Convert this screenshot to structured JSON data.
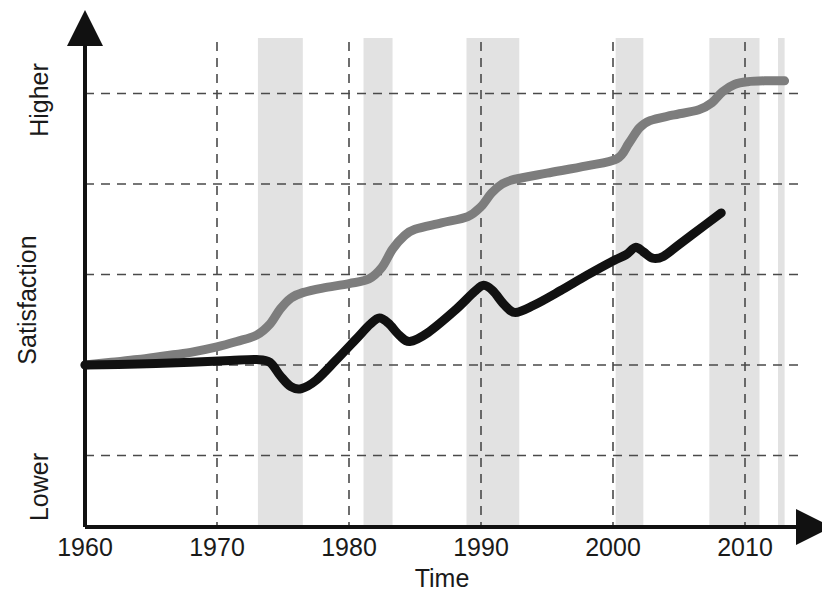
{
  "chart_data": {
    "type": "line",
    "title": "",
    "subtitle": "",
    "xlabel": "Time",
    "ylabel": "Satisfaction",
    "grid": true,
    "legend_position": "none",
    "x_tick_labels": [
      "1960",
      "1970",
      "1980",
      "1990",
      "2000",
      "2010"
    ],
    "x_ticks": [
      1960,
      1970,
      1980,
      1990,
      2000,
      2010
    ],
    "xlim": [
      1960,
      2013
    ],
    "y_tick_labels": [
      "Higher",
      "Lower"
    ],
    "y_axis_high_label": "Higher",
    "y_axis_low_label": "Lower",
    "ylim": [
      -2,
      3
    ],
    "y_gridlines": [
      3,
      2,
      1,
      0,
      -1
    ],
    "shaded_bands_label": "recession-band",
    "shaded_bands": [
      {
        "start": 1973.1,
        "end": 1976.5
      },
      {
        "start": 1981.1,
        "end": 1983.3
      },
      {
        "start": 1988.9,
        "end": 1992.9
      },
      {
        "start": 2000.2,
        "end": 2002.3
      },
      {
        "start": 2007.3,
        "end": 2011.1
      },
      {
        "start": 2012.5,
        "end": 2013.0
      }
    ],
    "series": [
      {
        "name": "gray-series",
        "color": "#7d7d7d",
        "points": [
          [
            1960.0,
            0.0
          ],
          [
            1962.0,
            0.03
          ],
          [
            1964.0,
            0.06
          ],
          [
            1966.0,
            0.1
          ],
          [
            1968.0,
            0.14
          ],
          [
            1970.0,
            0.2
          ],
          [
            1971.5,
            0.26
          ],
          [
            1973.0,
            0.33
          ],
          [
            1974.0,
            0.45
          ],
          [
            1974.8,
            0.62
          ],
          [
            1975.6,
            0.74
          ],
          [
            1976.5,
            0.8
          ],
          [
            1978.0,
            0.85
          ],
          [
            1980.0,
            0.9
          ],
          [
            1981.5,
            0.95
          ],
          [
            1982.5,
            1.08
          ],
          [
            1983.3,
            1.28
          ],
          [
            1984.2,
            1.43
          ],
          [
            1985.0,
            1.5
          ],
          [
            1987.0,
            1.57
          ],
          [
            1989.0,
            1.64
          ],
          [
            1990.0,
            1.75
          ],
          [
            1990.8,
            1.9
          ],
          [
            1991.6,
            2.0
          ],
          [
            1992.5,
            2.05
          ],
          [
            1995.0,
            2.12
          ],
          [
            1998.0,
            2.2
          ],
          [
            2000.3,
            2.28
          ],
          [
            2001.2,
            2.45
          ],
          [
            2002.0,
            2.62
          ],
          [
            2002.8,
            2.7
          ],
          [
            2004.5,
            2.76
          ],
          [
            2006.5,
            2.82
          ],
          [
            2007.5,
            2.9
          ],
          [
            2008.3,
            3.02
          ],
          [
            2009.2,
            3.1
          ],
          [
            2010.2,
            3.13
          ],
          [
            2011.5,
            3.14
          ],
          [
            2013.0,
            3.14
          ]
        ]
      },
      {
        "name": "black-series",
        "color": "#111111",
        "points": [
          [
            1960.0,
            0.0
          ],
          [
            1964.0,
            0.01
          ],
          [
            1968.0,
            0.03
          ],
          [
            1971.0,
            0.05
          ],
          [
            1973.0,
            0.06
          ],
          [
            1974.0,
            0.03
          ],
          [
            1974.8,
            -0.12
          ],
          [
            1975.6,
            -0.24
          ],
          [
            1976.4,
            -0.26
          ],
          [
            1977.5,
            -0.17
          ],
          [
            1979.0,
            0.05
          ],
          [
            1980.5,
            0.28
          ],
          [
            1981.6,
            0.45
          ],
          [
            1982.3,
            0.52
          ],
          [
            1983.0,
            0.46
          ],
          [
            1983.8,
            0.33
          ],
          [
            1984.6,
            0.26
          ],
          [
            1986.0,
            0.36
          ],
          [
            1988.0,
            0.6
          ],
          [
            1989.5,
            0.81
          ],
          [
            1990.2,
            0.88
          ],
          [
            1990.9,
            0.82
          ],
          [
            1991.8,
            0.66
          ],
          [
            1992.6,
            0.58
          ],
          [
            1994.0,
            0.66
          ],
          [
            1996.0,
            0.82
          ],
          [
            1998.0,
            0.99
          ],
          [
            2000.0,
            1.15
          ],
          [
            2001.0,
            1.22
          ],
          [
            2001.7,
            1.3
          ],
          [
            2002.3,
            1.25
          ],
          [
            2003.0,
            1.18
          ],
          [
            2003.8,
            1.2
          ],
          [
            2005.0,
            1.33
          ],
          [
            2007.0,
            1.55
          ],
          [
            2008.2,
            1.68
          ]
        ]
      }
    ]
  },
  "axes": {
    "x_axis_name": "time-axis",
    "y_axis_name": "satisfaction-axis"
  }
}
